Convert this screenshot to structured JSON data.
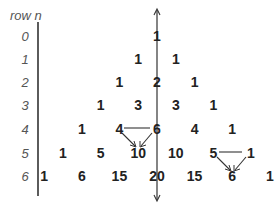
{
  "diagram": {
    "header_label": "row n",
    "rows": [
      {
        "n": "0",
        "values": [
          "1"
        ]
      },
      {
        "n": "1",
        "values": [
          "1",
          "1"
        ]
      },
      {
        "n": "2",
        "values": [
          "1",
          "2",
          "1"
        ]
      },
      {
        "n": "3",
        "values": [
          "1",
          "3",
          "3",
          "1"
        ]
      },
      {
        "n": "4",
        "values": [
          "1",
          "4",
          "6",
          "4",
          "1"
        ]
      },
      {
        "n": "5",
        "values": [
          "1",
          "5",
          "10",
          "10",
          "5",
          "1"
        ]
      },
      {
        "n": "6",
        "values": [
          "1",
          "6",
          "15",
          "20",
          "15",
          "6",
          "1"
        ]
      }
    ],
    "annotations": [
      {
        "from": [
          "4,1",
          "4,2"
        ],
        "to": "5,2",
        "note": "4 + 6 = 10"
      },
      {
        "from": [
          "5,4",
          "5,5"
        ],
        "to": "6,5",
        "note": "5 + 1 = 6"
      }
    ],
    "axis": {
      "type": "vertical double arrow",
      "through": "center column"
    },
    "colors": {
      "text": "#222222",
      "label": "#555555",
      "line": "#333333"
    }
  }
}
